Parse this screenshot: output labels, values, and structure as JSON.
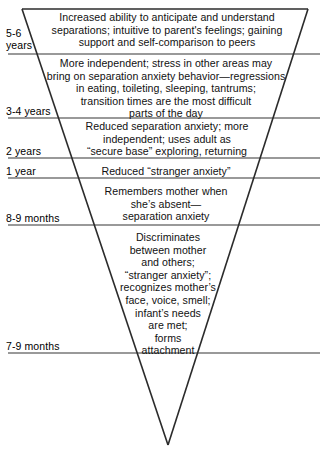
{
  "figure": {
    "type": "inverted-triangle-timeline",
    "colors": {
      "background": "#ffffff",
      "triangle_stroke": "#2b2b2b",
      "divider_line": "#777777",
      "text": "#111111"
    },
    "geometry": {
      "triangle_top_left_x": 22,
      "triangle_top_right_x": 308,
      "triangle_top_y": 9,
      "triangle_apex_x": 168,
      "triangle_apex_y": 445,
      "divider_x_start": 8,
      "divider_x_end": 320
    }
  },
  "bands": [
    {
      "age": "5-6\nyears",
      "age_top": 28,
      "divider_y": 54,
      "text": "Increased ability to anticipate and understand\nseparations; intuitive to parent's feelings; gaining\nsupport and self-comparison to peers",
      "text_top": 11,
      "text_left": 42,
      "text_width": 250
    },
    {
      "age": "3-4 years",
      "age_top": 106,
      "divider_y": 118,
      "text": "More independent; stress in other areas may\nbring on separation anxiety behavior—regressions\nin eating, toileting, sleeping, tantrums;\ntransition times are the most difficult\nparts of the day",
      "text_top": 57,
      "text_left": 38,
      "text_width": 256
    },
    {
      "age": "2 years",
      "age_top": 146,
      "divider_y": 158,
      "text": "Reduced separation anxiety; more\nindependent; uses adult as\n“secure base” exploring, returning",
      "text_top": 120,
      "text_left": 56,
      "text_width": 222
    },
    {
      "age": "1 year",
      "age_top": 166,
      "divider_y": 178,
      "text": "Reduced “stranger anxiety”",
      "text_top": 165,
      "text_left": 62,
      "text_width": 208
    },
    {
      "age": "8-9 months",
      "age_top": 213,
      "divider_y": 225,
      "text": "Remembers mother when\nshe’s absent—\nseparation anxiety",
      "text_top": 185,
      "text_left": 70,
      "text_width": 192
    },
    {
      "age": "7-9 months",
      "age_top": 341,
      "divider_y": 353,
      "text": "Discriminates\nbetween mother\nand others;\n“stranger anxiety”;\nrecognizes mother’s\nface, voice, smell;\ninfant’s needs\nare met;\nforms\nattachment",
      "text_top": 231,
      "text_left": 88,
      "text_width": 160
    }
  ]
}
